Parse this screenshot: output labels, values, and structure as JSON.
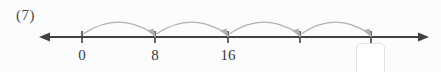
{
  "figure": {
    "question_number": "(7)",
    "background_color": "#fcfcfc",
    "axis_color": "#404040",
    "jump_color": "#b0b0b0",
    "box_border_color": "#e2e2e2"
  },
  "number_line": {
    "axis_y": 37,
    "axis_start_x": 48,
    "axis_end_x": 420,
    "left_arrow": "arrow-left",
    "right_arrow": "arrow-right",
    "ticks": [
      {
        "x": 82,
        "label": "0"
      },
      {
        "x": 155,
        "label": "8"
      },
      {
        "x": 228,
        "label": "16"
      },
      {
        "x": 300,
        "label": ""
      },
      {
        "x": 371,
        "label": ""
      }
    ],
    "jumps": [
      {
        "from_x": 82,
        "to_x": 155
      },
      {
        "from_x": 155,
        "to_x": 228
      },
      {
        "from_x": 228,
        "to_x": 300
      },
      {
        "from_x": 300,
        "to_x": 371
      }
    ],
    "jump_size": 8
  },
  "answer_box": {
    "value": "",
    "placeholder": "",
    "x": 356,
    "y": 43,
    "width": 29,
    "height": 34
  }
}
